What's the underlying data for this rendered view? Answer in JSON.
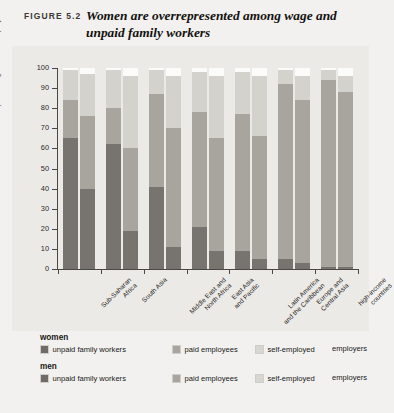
{
  "figure": {
    "number_label": "FIGURE 5.2",
    "title": "Women are overrepresented among wage and unpaid family workers"
  },
  "axes": {
    "ylabel": "percentage of total employment",
    "yticks": [
      0,
      10,
      20,
      30,
      40,
      50,
      60,
      70,
      80,
      90,
      100
    ],
    "ymin": 0,
    "ymax": 100
  },
  "legend": {
    "groups": [
      {
        "heading": "women",
        "items": [
          {
            "label": "unpaid family workers",
            "color": "#6f6c67",
            "key": "unpaid"
          },
          {
            "label": "paid employees",
            "color": "#a8a59f",
            "key": "paid"
          },
          {
            "label": "self-employed",
            "color": "#d8d6d1",
            "key": "self"
          },
          {
            "label": "employers",
            "color": "#ffffff",
            "key": "emp"
          }
        ]
      },
      {
        "heading": "men",
        "items": [
          {
            "label": "unpaid family workers",
            "color": "#6f6c67",
            "key": "unpaid"
          },
          {
            "label": "paid employees",
            "color": "#a8a59f",
            "key": "paid"
          },
          {
            "label": "self-employed",
            "color": "#d8d6d1",
            "key": "self"
          },
          {
            "label": "employers",
            "color": "#ffffff",
            "key": "emp"
          }
        ]
      }
    ]
  },
  "chart_data": {
    "type": "bar",
    "subtype": "grouped-stacked",
    "title": "Women are overrepresented among wage and unpaid family workers",
    "xlabel": "",
    "ylabel": "percentage of total employment",
    "ylim": [
      0,
      100
    ],
    "yticks": [
      0,
      10,
      20,
      30,
      40,
      50,
      60,
      70,
      80,
      90,
      100
    ],
    "grid": false,
    "legend_position": "bottom",
    "stack_order": [
      "unpaid family workers",
      "paid employees",
      "self-employed",
      "employers"
    ],
    "stack_colors": {
      "unpaid family workers": "#77746f",
      "paid employees": "#a8a59f",
      "self-employed": "#d4d2cd",
      "employers": "#fbfbfa"
    },
    "categories": [
      "Sub-Saharan Africa",
      "South Asia",
      "Middle East and North Africa",
      "East Asia and Pacific",
      "Latin America and the Caribbean",
      "Europe and Central Asia",
      "high-income countries"
    ],
    "category_lines": [
      [
        "Sub-Saharan",
        "Africa"
      ],
      [
        "South Asia"
      ],
      [
        "Middle East and",
        "North Africa"
      ],
      [
        "East Asia",
        "and Pacific"
      ],
      [
        "Latin America",
        "and the Caribbean"
      ],
      [
        "Europe and",
        "Central Asia"
      ],
      [
        "high-income",
        "countries"
      ]
    ],
    "series": [
      {
        "name": "women",
        "stacks": [
          {
            "unpaid family workers": 65,
            "paid employees": 19,
            "self-employed": 15,
            "employers": 1
          },
          {
            "unpaid family workers": 62,
            "paid employees": 18,
            "self-employed": 19,
            "employers": 1
          },
          {
            "unpaid family workers": 41,
            "paid employees": 46,
            "self-employed": 12,
            "employers": 1
          },
          {
            "unpaid family workers": 21,
            "paid employees": 57,
            "self-employed": 20,
            "employers": 2
          },
          {
            "unpaid family workers": 9,
            "paid employees": 68,
            "self-employed": 21,
            "employers": 2
          },
          {
            "unpaid family workers": 5,
            "paid employees": 87,
            "self-employed": 7,
            "employers": 1
          },
          {
            "unpaid family workers": 1,
            "paid employees": 93,
            "self-employed": 5,
            "employers": 1
          }
        ]
      },
      {
        "name": "men",
        "stacks": [
          {
            "unpaid family workers": 40,
            "paid employees": 36,
            "self-employed": 21,
            "employers": 3
          },
          {
            "unpaid family workers": 19,
            "paid employees": 41,
            "self-employed": 36,
            "employers": 4
          },
          {
            "unpaid family workers": 11,
            "paid employees": 59,
            "self-employed": 26,
            "employers": 4
          },
          {
            "unpaid family workers": 9,
            "paid employees": 56,
            "self-employed": 31,
            "employers": 4
          },
          {
            "unpaid family workers": 5,
            "paid employees": 61,
            "self-employed": 30,
            "employers": 4
          },
          {
            "unpaid family workers": 3,
            "paid employees": 81,
            "self-employed": 12,
            "employers": 4
          },
          {
            "unpaid family workers": 1,
            "paid employees": 87,
            "self-employed": 8,
            "employers": 4
          }
        ]
      }
    ]
  }
}
